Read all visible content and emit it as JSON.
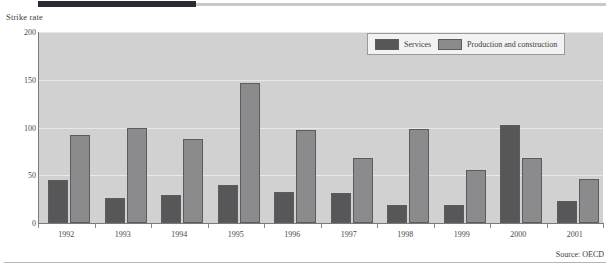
{
  "axis_title": "Strike rate",
  "source_note": "Source: OECD",
  "colors": {
    "services": "#575759",
    "production": "#8b8b8d",
    "plot_background": "#d1d1d1",
    "gridline": "#e9e9e9",
    "axis": "#7a7a7a",
    "top_rule": "#2b2b33"
  },
  "legend": {
    "entries": [
      {
        "label": "Services",
        "key": "services"
      },
      {
        "label": "Production and construction",
        "key": "production"
      }
    ]
  },
  "chart_data": {
    "type": "bar",
    "title": "",
    "xlabel": "",
    "ylabel": "Strike rate",
    "ylim": [
      0,
      200
    ],
    "yticks": [
      0,
      50,
      100,
      150,
      200
    ],
    "ytick_labels": [
      "0",
      "50",
      "100",
      "150",
      "200"
    ],
    "grid": true,
    "legend_position": "top-right",
    "categories": [
      "1992",
      "1993",
      "1994",
      "1995",
      "1996",
      "1997",
      "1998",
      "1999",
      "2000",
      "2001"
    ],
    "series": [
      {
        "name": "Services",
        "color": "#575759",
        "values": [
          45,
          26,
          29,
          40,
          33,
          31,
          19,
          19,
          103,
          23
        ]
      },
      {
        "name": "Production and construction",
        "color": "#8b8b8d",
        "values": [
          92,
          99,
          88,
          147,
          97,
          68,
          98,
          55,
          68,
          46
        ]
      }
    ]
  }
}
